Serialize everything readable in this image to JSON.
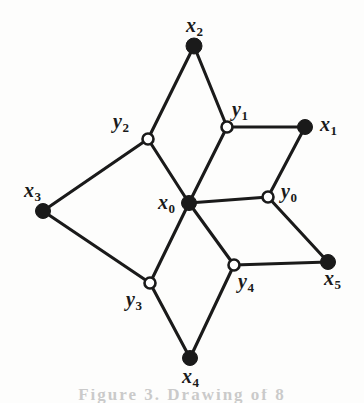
{
  "figure": {
    "type": "graph-diagram",
    "width": 364,
    "height": 403,
    "background_color": "#fdfdfc",
    "edge_color": "#1a1a1a",
    "filled_node_color": "#1a1a1a",
    "open_node_fill": "#ffffff",
    "open_node_stroke": "#1a1a1a",
    "caption_partial": "Figure 3. Drawing of  8"
  },
  "nodes": [
    {
      "id": "x0",
      "label": "x",
      "sub": "0",
      "x": 189,
      "y": 203,
      "style": "filled",
      "r": 7.5,
      "label_x": 158,
      "label_y": 192,
      "label_anchor": "left"
    },
    {
      "id": "x1",
      "label": "x",
      "sub": "1",
      "x": 305,
      "y": 127,
      "style": "filled",
      "r": 7.5,
      "label_x": 320,
      "label_y": 114,
      "label_anchor": "left"
    },
    {
      "id": "x2",
      "label": "x",
      "sub": "2",
      "x": 194,
      "y": 46,
      "style": "filled",
      "r": 8.0,
      "label_x": 186,
      "label_y": 15,
      "label_anchor": "left"
    },
    {
      "id": "x3",
      "label": "x",
      "sub": "3",
      "x": 43,
      "y": 211,
      "style": "filled",
      "r": 7.5,
      "label_x": 24,
      "label_y": 180,
      "label_anchor": "left"
    },
    {
      "id": "x4",
      "label": "x",
      "sub": "4",
      "x": 190,
      "y": 358,
      "style": "filled",
      "r": 7.5,
      "label_x": 182,
      "label_y": 366,
      "label_anchor": "left"
    },
    {
      "id": "x5",
      "label": "x",
      "sub": "5",
      "x": 328,
      "y": 262,
      "style": "filled",
      "r": 7.5,
      "label_x": 324,
      "label_y": 268,
      "label_anchor": "left"
    },
    {
      "id": "y0",
      "label": "y",
      "sub": "0",
      "x": 268,
      "y": 197,
      "style": "open",
      "r": 5.5,
      "label_x": 281,
      "label_y": 181,
      "label_anchor": "left"
    },
    {
      "id": "y1",
      "label": "y",
      "sub": "1",
      "x": 227,
      "y": 127,
      "style": "open",
      "r": 5.5,
      "label_x": 232,
      "label_y": 99,
      "label_anchor": "left"
    },
    {
      "id": "y2",
      "label": "y",
      "sub": "2",
      "x": 148,
      "y": 139,
      "style": "open",
      "r": 5.5,
      "label_x": 113,
      "label_y": 111,
      "label_anchor": "left"
    },
    {
      "id": "y3",
      "label": "y",
      "sub": "3",
      "x": 150,
      "y": 283,
      "style": "open",
      "r": 5.5,
      "label_x": 126,
      "label_y": 289,
      "label_anchor": "left"
    },
    {
      "id": "y4",
      "label": "y",
      "sub": "4",
      "x": 234,
      "y": 265,
      "style": "open",
      "r": 5.5,
      "label_x": 238,
      "label_y": 271,
      "label_anchor": "left"
    }
  ],
  "edges": [
    {
      "from": "x0",
      "to": "y0"
    },
    {
      "from": "x0",
      "to": "y1"
    },
    {
      "from": "x0",
      "to": "y2"
    },
    {
      "from": "x0",
      "to": "y3"
    },
    {
      "from": "x0",
      "to": "y4"
    },
    {
      "from": "y1",
      "to": "x1"
    },
    {
      "from": "x1",
      "to": "y0"
    },
    {
      "from": "y0",
      "to": "x5"
    },
    {
      "from": "x5",
      "to": "y4"
    },
    {
      "from": "y4",
      "to": "x4"
    },
    {
      "from": "x4",
      "to": "y3"
    },
    {
      "from": "y3",
      "to": "x3"
    },
    {
      "from": "x3",
      "to": "y2"
    },
    {
      "from": "y2",
      "to": "x2"
    },
    {
      "from": "x2",
      "to": "y1"
    }
  ]
}
